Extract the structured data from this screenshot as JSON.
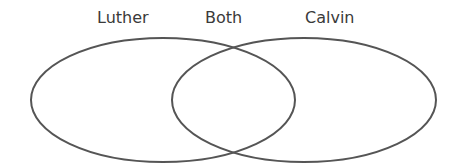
{
  "diagram": {
    "type": "venn",
    "labels": {
      "left": "Luther",
      "center": "Both",
      "right": "Calvin"
    },
    "sets": [
      {
        "name": "Luther",
        "cx": 163,
        "cy": 100,
        "rx": 132,
        "ry": 62
      },
      {
        "name": "Calvin",
        "cx": 304,
        "cy": 100,
        "rx": 132,
        "ry": 62
      }
    ],
    "stroke_color": "#555555",
    "text_color": "#3a3a3a"
  }
}
